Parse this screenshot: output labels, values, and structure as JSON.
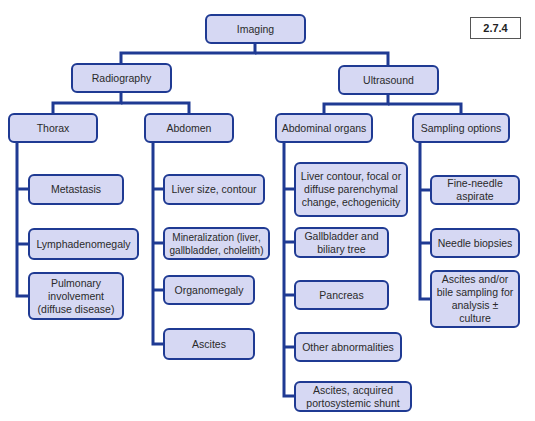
{
  "figure_label": "2.7.4",
  "colors": {
    "box_fill": "#d6d8f3",
    "box_border": "#1f3a93",
    "connector": "#1f3a93"
  },
  "root": {
    "label": "Imaging"
  },
  "branches": [
    {
      "label": "Radiography",
      "groups": [
        {
          "label": "Thorax",
          "items": [
            "Metastasis",
            "Lymphadenomegaly",
            "Pulmonary\ninvolvement\n(diffuse disease)"
          ]
        },
        {
          "label": "Abdomen",
          "items": [
            "Liver size, contour",
            "Mineralization (liver,\ngallbladder, cholelith)",
            "Organomegaly",
            "Ascites"
          ]
        }
      ]
    },
    {
      "label": "Ultrasound",
      "groups": [
        {
          "label": "Abdominal organs",
          "items": [
            "Liver contour, focal or\ndiffuse parenchymal\nchange, echogenicity",
            "Gallbladder and\nbiliary tree",
            "Pancreas",
            "Other abnormalities",
            "Ascites, acquired\nportosystemic shunt"
          ]
        },
        {
          "label": "Sampling options",
          "items": [
            "Fine-needle\naspirate",
            "Needle biopsies",
            "Ascites and/or\nbile sampling for\nanalysis ± culture"
          ]
        }
      ]
    }
  ]
}
